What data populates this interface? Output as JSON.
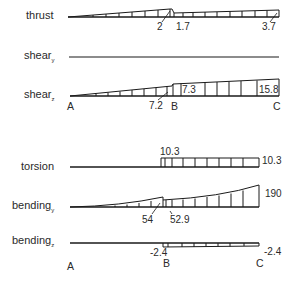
{
  "diagram": {
    "type": "internal force diagrams along beam A-B-C",
    "points": {
      "A": "A",
      "B": "B",
      "C": "C"
    },
    "rows": [
      {
        "id": "thrust",
        "label": "thrust",
        "subscript": "",
        "values": {
          "before_B": "2",
          "after_B": "1.7",
          "at_C": "3.7"
        }
      },
      {
        "id": "shear_y",
        "label": "shear",
        "subscript": "y",
        "values": {}
      },
      {
        "id": "shear_z",
        "label": "shear",
        "subscript": "z",
        "values": {
          "before_B": "7.2",
          "after_B": "7.3",
          "at_C": "15.8"
        }
      },
      {
        "id": "torsion",
        "label": "torsion",
        "subscript": "",
        "values": {
          "after_B": "10.3",
          "at_C": "10.3"
        }
      },
      {
        "id": "bending_y",
        "label": "bending",
        "subscript": "y",
        "values": {
          "before_B": "54",
          "after_B": "52.9",
          "at_C": "190"
        }
      },
      {
        "id": "bending_z",
        "label": "bending",
        "subscript": "z",
        "values": {
          "after_B": "-2.4",
          "at_C": "-2.4"
        }
      }
    ]
  },
  "colors": {
    "line": "#1a1a1a",
    "text": "#2a2a2a",
    "background": "#ffffff"
  }
}
